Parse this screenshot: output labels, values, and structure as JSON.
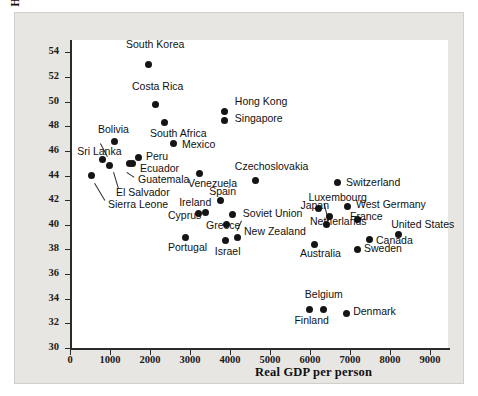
{
  "chart_data": {
    "type": "scatter",
    "title": "",
    "xlabel": "Real GDP per person",
    "ylabel_line1": "Hours of work",
    "ylabel_line2": "per week",
    "xlim": [
      0,
      9500
    ],
    "ylim": [
      30,
      55
    ],
    "xticks": [
      0,
      1000,
      2000,
      3000,
      4000,
      5000,
      6000,
      7000,
      8000,
      9000
    ],
    "yticks": [
      30,
      32,
      34,
      36,
      38,
      40,
      42,
      44,
      46,
      48,
      50,
      52,
      54
    ],
    "grid": false,
    "legend": "none",
    "points": [
      {
        "label": "South Korea",
        "x": 1950,
        "y": 53.0,
        "lx": 1400,
        "ly": 54.6
      },
      {
        "label": "Costa Rica",
        "x": 2130,
        "y": 49.8,
        "lx": 1550,
        "ly": 51.2
      },
      {
        "label": "South Africa",
        "x": 2350,
        "y": 48.3,
        "lx": 2000,
        "ly": 47.4
      },
      {
        "label": "Hong Kong",
        "x": 3860,
        "y": 49.2,
        "lx": 4120,
        "ly": 50.0
      },
      {
        "label": "Singapore",
        "x": 3860,
        "y": 48.5,
        "lx": 4120,
        "ly": 48.6
      },
      {
        "label": "Mexico",
        "x": 2580,
        "y": 46.6,
        "lx": 2800,
        "ly": 46.5
      },
      {
        "label": "Bolivia",
        "x": 1120,
        "y": 46.8,
        "lx": 700,
        "ly": 47.7
      },
      {
        "label": "Sri Lanka",
        "x": 800,
        "y": 45.3,
        "lx": 180,
        "ly": 45.9
      },
      {
        "label": "Peru",
        "x": 1700,
        "y": 45.5,
        "lx": 1900,
        "ly": 45.5
      },
      {
        "label": "Ecuador",
        "x": 1560,
        "y": 45.0,
        "lx": 1750,
        "ly": 44.5
      },
      {
        "label": "Guatemala",
        "x": 1480,
        "y": 45.0,
        "lx": 1700,
        "ly": 43.6
      },
      {
        "label": "El Salvador",
        "x": 980,
        "y": 44.8,
        "lx": 1150,
        "ly": 42.6
      },
      {
        "label": "Sierra Leone",
        "x": 530,
        "y": 44.0,
        "lx": 950,
        "ly": 41.6
      },
      {
        "label": "Czechoslovakia",
        "x": 4630,
        "y": 43.6,
        "lx": 4120,
        "ly": 44.7
      },
      {
        "label": "Venezuela",
        "x": 3230,
        "y": 44.2,
        "lx": 2950,
        "ly": 43.3
      },
      {
        "label": "Switzerland",
        "x": 6680,
        "y": 43.4,
        "lx": 6900,
        "ly": 43.4
      },
      {
        "label": "Spain",
        "x": 3750,
        "y": 42.0,
        "lx": 3480,
        "ly": 42.7
      },
      {
        "label": "Luxembourg",
        "x": 6480,
        "y": 40.7,
        "lx": 5960,
        "ly": 42.2
      },
      {
        "label": "West Germany",
        "x": 6940,
        "y": 41.5,
        "lx": 7150,
        "ly": 41.6
      },
      {
        "label": "Japan",
        "x": 6200,
        "y": 41.3,
        "lx": 5760,
        "ly": 41.5
      },
      {
        "label": "Ireland",
        "x": 3380,
        "y": 41.0,
        "lx": 2730,
        "ly": 41.8
      },
      {
        "label": "Cyprus",
        "x": 3220,
        "y": 40.9,
        "lx": 2450,
        "ly": 40.7
      },
      {
        "label": "France",
        "x": 7180,
        "y": 40.4,
        "lx": 7000,
        "ly": 40.6
      },
      {
        "label": "Soviet Union",
        "x": 4060,
        "y": 40.8,
        "lx": 4320,
        "ly": 40.9
      },
      {
        "label": "Netherlands",
        "x": 6420,
        "y": 40.0,
        "lx": 6000,
        "ly": 40.2
      },
      {
        "label": "Greece",
        "x": 3900,
        "y": 40.0,
        "lx": 3400,
        "ly": 39.9
      },
      {
        "label": "New Zealand",
        "x": 4180,
        "y": 39.0,
        "lx": 4350,
        "ly": 39.4
      },
      {
        "label": "United States",
        "x": 8200,
        "y": 39.2,
        "lx": 8030,
        "ly": 40.0
      },
      {
        "label": "Canada",
        "x": 7480,
        "y": 38.8,
        "lx": 7650,
        "ly": 38.7
      },
      {
        "label": "Sweden",
        "x": 7180,
        "y": 38.0,
        "lx": 7350,
        "ly": 38.0
      },
      {
        "label": "Australia",
        "x": 6100,
        "y": 38.4,
        "lx": 5750,
        "ly": 37.6
      },
      {
        "label": "Portugal",
        "x": 2880,
        "y": 39.0,
        "lx": 2450,
        "ly": 38.1
      },
      {
        "label": "Israel",
        "x": 3880,
        "y": 38.7,
        "lx": 3620,
        "ly": 37.8
      },
      {
        "label": "Belgium",
        "x": 6330,
        "y": 33.1,
        "lx": 5870,
        "ly": 34.3
      },
      {
        "label": "Finland",
        "x": 5980,
        "y": 33.1,
        "lx": 5610,
        "ly": 32.2
      },
      {
        "label": "Denmark",
        "x": 6900,
        "y": 32.8,
        "lx": 7080,
        "ly": 32.9
      }
    ],
    "leaders": [
      {
        "x1": 920,
        "y1": 45.5,
        "x2": 740,
        "y2": 46.6
      },
      {
        "x1": 1110,
        "y1": 44.3,
        "x2": 1230,
        "y2": 43.0
      },
      {
        "x1": 1430,
        "y1": 44.3,
        "x2": 1620,
        "y2": 43.9
      },
      {
        "x1": 620,
        "y1": 43.4,
        "x2": 880,
        "y2": 42.0
      },
      {
        "x1": 6440,
        "y1": 40.3,
        "x2": 6330,
        "y2": 41.7
      },
      {
        "x1": 4290,
        "y1": 40.3,
        "x2": 4180,
        "y2": 39.5
      }
    ]
  }
}
